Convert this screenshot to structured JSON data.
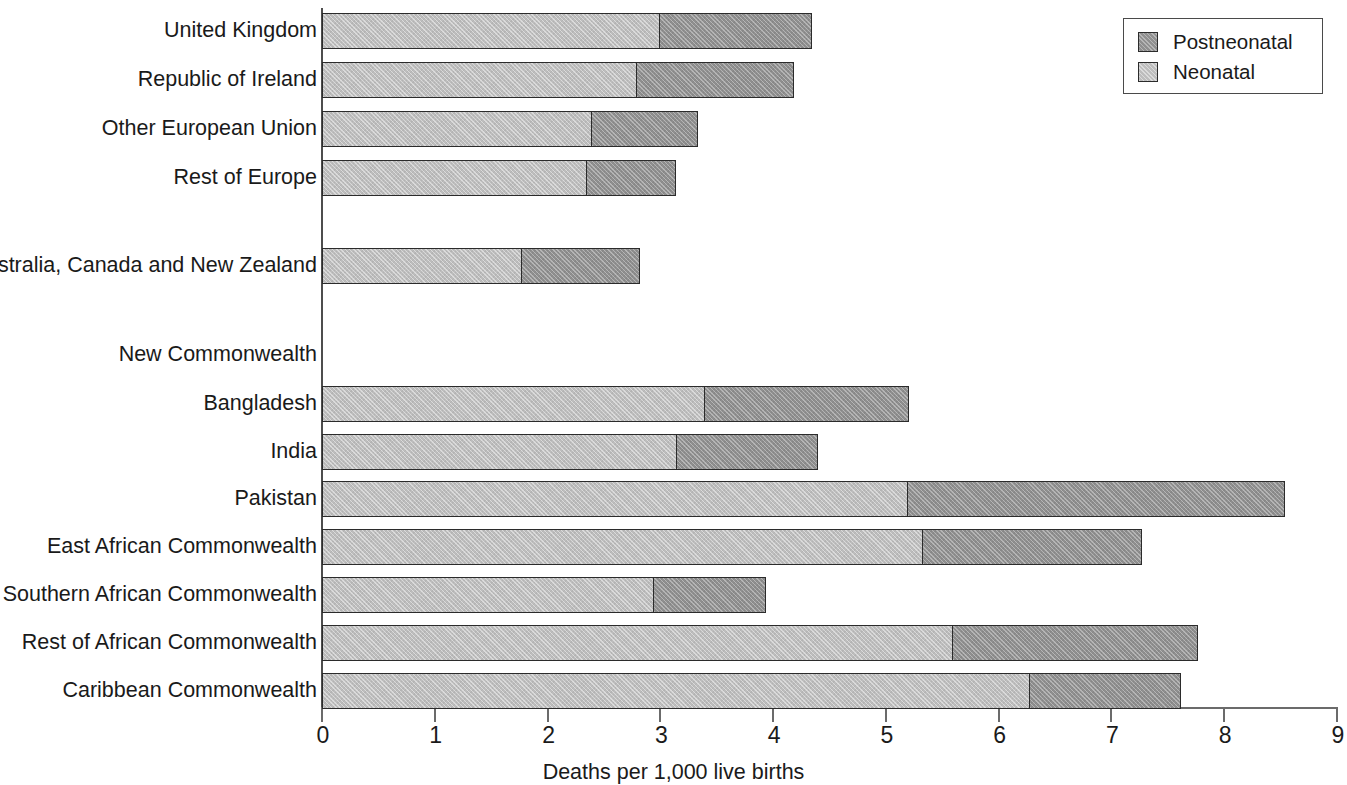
{
  "chart_data": {
    "type": "bar",
    "orientation": "horizontal",
    "stacked": true,
    "title": "",
    "xlabel": "Deaths per 1,000 live births",
    "ylabel": "",
    "xlim": [
      0,
      9
    ],
    "xticks": [
      "0",
      "1",
      "2",
      "3",
      "4",
      "5",
      "6",
      "7",
      "8",
      "9"
    ],
    "grid": false,
    "legend_position": "top-right",
    "legend": [
      "Postneonatal",
      "Neonatal"
    ],
    "categories": [
      "United Kingdom",
      "Republic of Ireland",
      "Other European Union",
      "Rest of Europe",
      "Australia, Canada and New Zealand",
      "New Commonwealth",
      "Bangladesh",
      "India",
      "Pakistan",
      "East African Commonwealth",
      "Southern African Commonwealth",
      "Rest of African Commonwealth",
      "Caribbean Commonwealth"
    ],
    "series": [
      {
        "name": "Neonatal",
        "color": "#bdbdbd",
        "values": [
          3.0,
          2.8,
          2.4,
          2.35,
          1.78,
          null,
          3.4,
          3.15,
          5.2,
          5.33,
          2.95,
          5.6,
          6.28
        ]
      },
      {
        "name": "Postneonatal",
        "color": "#8f8f8f",
        "values": [
          1.36,
          1.4,
          0.95,
          0.8,
          1.05,
          null,
          1.82,
          1.26,
          3.35,
          1.95,
          1.0,
          2.18,
          1.35
        ]
      }
    ],
    "totals": [
      4.36,
      4.2,
      3.35,
      3.15,
      2.83,
      null,
      5.22,
      4.41,
      8.55,
      7.28,
      3.95,
      7.78,
      7.63
    ],
    "group_header_categories": [
      "New Commonwealth"
    ],
    "rows": [
      {
        "label": "United Kingdom",
        "neonatal": 3.0,
        "postneonatal": 1.36,
        "total": 4.36,
        "has_bar": true,
        "top": 13,
        "height": 36
      },
      {
        "label": "Republic of Ireland",
        "neonatal": 2.8,
        "postneonatal": 1.4,
        "total": 4.2,
        "has_bar": true,
        "top": 62,
        "height": 36
      },
      {
        "label": "Other European Union",
        "neonatal": 2.4,
        "postneonatal": 0.95,
        "total": 3.35,
        "has_bar": true,
        "top": 111,
        "height": 36
      },
      {
        "label": "Rest of Europe",
        "neonatal": 2.35,
        "postneonatal": 0.8,
        "total": 3.15,
        "has_bar": true,
        "top": 160,
        "height": 36
      },
      {
        "label": "Australia, Canada and New Zealand",
        "neonatal": 1.78,
        "postneonatal": 1.05,
        "total": 2.83,
        "has_bar": true,
        "top": 248,
        "height": 36
      },
      {
        "label": "New Commonwealth",
        "neonatal": null,
        "postneonatal": null,
        "total": null,
        "has_bar": false,
        "top": 337,
        "height": 36
      },
      {
        "label": "Bangladesh",
        "neonatal": 3.4,
        "postneonatal": 1.82,
        "total": 5.22,
        "has_bar": true,
        "top": 386,
        "height": 36
      },
      {
        "label": "India",
        "neonatal": 3.15,
        "postneonatal": 1.26,
        "total": 4.41,
        "has_bar": true,
        "top": 434,
        "height": 36
      },
      {
        "label": "Pakistan",
        "neonatal": 5.2,
        "postneonatal": 3.35,
        "total": 8.55,
        "has_bar": true,
        "top": 481,
        "height": 36
      },
      {
        "label": "East African Commonwealth",
        "neonatal": 5.33,
        "postneonatal": 1.95,
        "total": 7.28,
        "has_bar": true,
        "top": 529,
        "height": 36
      },
      {
        "label": "Southern African Commonwealth",
        "neonatal": 2.95,
        "postneonatal": 1.0,
        "total": 3.95,
        "has_bar": true,
        "top": 577,
        "height": 36
      },
      {
        "label": "Rest of African Commonwealth",
        "neonatal": 5.6,
        "postneonatal": 2.18,
        "total": 7.78,
        "has_bar": true,
        "top": 625,
        "height": 36
      },
      {
        "label": "Caribbean Commonwealth",
        "neonatal": 6.28,
        "postneonatal": 1.35,
        "total": 7.63,
        "has_bar": true,
        "top": 673,
        "height": 36
      }
    ]
  },
  "legend": {
    "items": [
      {
        "label": "Postneonatal",
        "color": "#8f8f8f"
      },
      {
        "label": "Neonatal",
        "color": "#bdbdbd"
      }
    ]
  },
  "axis": {
    "x_title": "Deaths per 1,000 live births",
    "ticks": [
      "0",
      "1",
      "2",
      "3",
      "4",
      "5",
      "6",
      "7",
      "8",
      "9"
    ]
  }
}
